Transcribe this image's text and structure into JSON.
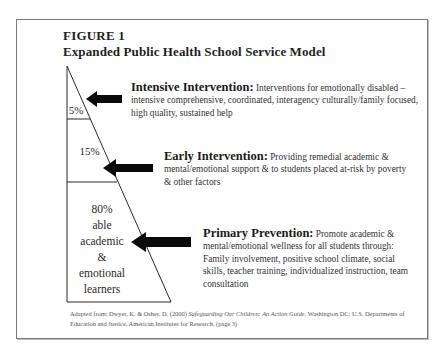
{
  "figure": {
    "number": "FIGURE 1",
    "title": "Expanded Public Health School Service Model"
  },
  "triangle": {
    "tiers": [
      {
        "label": "5%"
      },
      {
        "label": "15%"
      },
      {
        "label_lines": [
          "80%",
          "able",
          "academic",
          "&",
          "emotional",
          "learners"
        ]
      }
    ]
  },
  "tiers": [
    {
      "heading": "Intensive Intervention:",
      "text": " Interventions for emotionally disabled – intensive comprehensive, coordinated, interagency culturally/family focused, high quality, sustained help"
    },
    {
      "heading": "Early Intervention:",
      "text": " Providing remedial academic & mental/emotional support & to students placed at-risk by poverty & other factors"
    },
    {
      "heading": "Primary Prevention:",
      "text": " Promote academic & mental/emotional wellness for all students through: Family involvement, positive school climate, social skills, teacher training, individualized instruction, team consultation"
    }
  ],
  "credit": {
    "prefix": "Adapted from: Dwyer, K. & Osher, D. (2000) ",
    "book": "Safeguarding Our Children: An Action Guide.",
    "suffix": " Washington DC: U.S. Departments of Education and Justice, American Institutes for Research. (page 3)"
  },
  "colors": {
    "line": "#2a2a2a",
    "arrow": "#0a0a0a",
    "frame": "#7a7a7a"
  }
}
